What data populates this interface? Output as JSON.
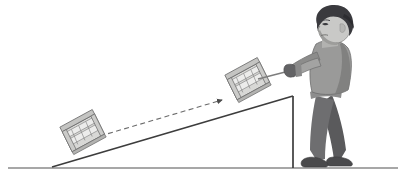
{
  "illustration": {
    "title": "Man pulling a crate up an inclined ramp",
    "description": "Physics diagram: a person pulls a wooden crate by a rope up a sloped ramp; a dashed arrow shows the crate's displacement from the bottom of the incline to its current position.",
    "canvas": {
      "width": 406,
      "height": 184,
      "background": "#ffffff"
    }
  },
  "colors": {
    "ground_line": "#8a8a8a",
    "ramp_line": "#3d3d3d",
    "ramp_support_line": "#3d3d3d",
    "crate_fill": "#d8d8d6",
    "crate_slat_fill": "#ececeb",
    "crate_outline": "#6e6e6e",
    "crate_shadow": "#b3b3b1",
    "rope": "#7d7d7d",
    "dashed_arrow": "#6b6b6b",
    "hair": "#3a3a3e",
    "skin": "#c9c9c7",
    "skin_shadow": "#9d9d9b",
    "sweater": "#9a9a99",
    "sweater_shadow": "#7c7c7b",
    "pants": "#6e6e70",
    "pants_shadow": "#5a5a5c",
    "shoe": "#4a4a4c",
    "glove": "#636365"
  },
  "elements": {
    "ground": {
      "name": "ground-line",
      "y": 168,
      "x_start": 8,
      "x_end": 398
    },
    "ramp": {
      "name": "inclined-plane",
      "base_point": [
        52,
        167
      ],
      "apex_point": [
        293,
        96
      ],
      "support_bottom": [
        293,
        168
      ],
      "angle_degrees": 16
    },
    "crate_lower": {
      "name": "crate-lower",
      "label": "crate at start position",
      "center": [
        78,
        141
      ],
      "width": 36,
      "height": 28,
      "rotation_degrees": -16
    },
    "crate_upper": {
      "name": "crate-upper",
      "label": "crate at current position",
      "center": [
        243,
        89
      ],
      "width": 36,
      "height": 28,
      "rotation_degrees": -16
    },
    "displacement_arrow": {
      "name": "displacement-arrow",
      "label": "displacement direction",
      "from": [
        100,
        135
      ],
      "to": [
        225,
        99
      ],
      "style": "dashed",
      "arrowhead": "triangle"
    },
    "rope": {
      "name": "pull-rope",
      "from": [
        258,
        80
      ],
      "to": [
        296,
        70
      ]
    },
    "person": {
      "name": "person-pulling",
      "label": "man pulling the rope",
      "head_center": [
        330,
        30
      ],
      "facing": "left",
      "garments": [
        "sweater",
        "pants",
        "shoes",
        "glove"
      ]
    }
  }
}
